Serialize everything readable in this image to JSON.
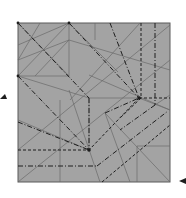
{
  "diagram": {
    "type": "origami-crease-pattern",
    "colors": {
      "paper": "#a3a3a3",
      "border": "#5a5a5a",
      "thin_crease": "#6a6a6a",
      "fold_line": "#1e1e1e",
      "background": "#ffffff"
    },
    "square": {
      "x": 18,
      "y": 23,
      "w": 152,
      "h": 159
    },
    "markers": [
      {
        "name": "left-arrow-marker",
        "x": 3,
        "y": 97
      },
      {
        "name": "bottom-right-arrow-marker",
        "x": 181,
        "y": 182
      }
    ],
    "nodes": [
      {
        "name": "top-left-corner",
        "x": 18,
        "y": 23
      },
      {
        "name": "top-edge-point",
        "x": 69,
        "y": 23
      },
      {
        "name": "left-edge-point",
        "x": 18,
        "y": 76
      },
      {
        "name": "right-node",
        "x": 139,
        "y": 98
      },
      {
        "name": "center-node",
        "x": 89,
        "y": 150
      }
    ]
  }
}
